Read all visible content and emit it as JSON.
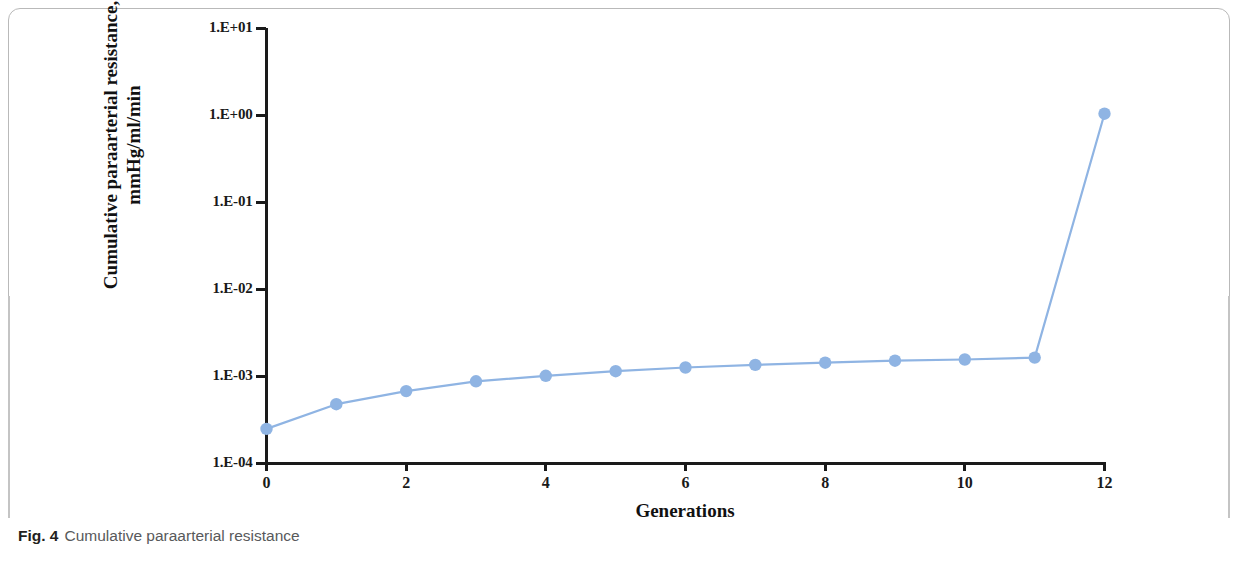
{
  "caption": {
    "label": "Fig. 4",
    "text": "Cumulative paraarterial resistance"
  },
  "colors": {
    "series": "#8FB4E3",
    "axis": "#1a1a1a",
    "frame": "#b9b9b9",
    "caption_label": "#231f20",
    "caption_text": "#58595b"
  },
  "chart_data": {
    "type": "line",
    "title": "",
    "xlabel": "Generations",
    "ylabel": "Cumulative paraarterial resistance, mmHg/ml/min",
    "ylabel_line1": "Cumulative paraarterial resistance,",
    "ylabel_line2": "mmHg/ml/min",
    "yscale": "log",
    "xscale": "linear",
    "xlim": [
      0,
      12
    ],
    "ylim": [
      0.0001,
      10
    ],
    "grid": false,
    "legend": false,
    "x_ticks": [
      0,
      2,
      4,
      6,
      8,
      10,
      12
    ],
    "x_tick_labels": [
      "0",
      "2",
      "4",
      "6",
      "8",
      "10",
      "12"
    ],
    "y_ticks": [
      0.0001,
      0.001,
      0.01,
      0.1,
      1,
      10
    ],
    "y_tick_labels": [
      "1.E-04",
      "1.E-03",
      "1.E-02",
      "1.E-01",
      "1.E+00",
      "1.E+01"
    ],
    "marker": "circle",
    "x": [
      0,
      1,
      2,
      3,
      4,
      5,
      6,
      7,
      8,
      9,
      10,
      11,
      12
    ],
    "values": [
      0.00025,
      0.00048,
      0.00068,
      0.00088,
      0.00102,
      0.00115,
      0.00127,
      0.00136,
      0.00144,
      0.00152,
      0.00157,
      0.00165,
      1.05
    ],
    "series": [
      {
        "name": "Cumulative paraarterial resistance",
        "values": [
          0.00025,
          0.00048,
          0.00068,
          0.00088,
          0.00102,
          0.00115,
          0.00127,
          0.00136,
          0.00144,
          0.00152,
          0.00157,
          0.00165,
          1.05
        ]
      }
    ]
  }
}
